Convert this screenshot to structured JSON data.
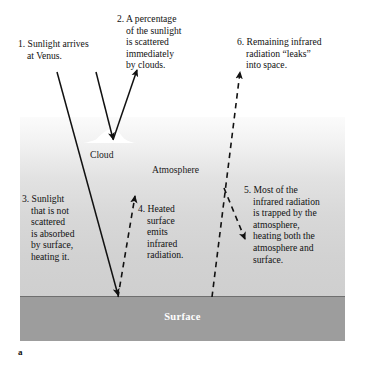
{
  "figure": {
    "letter": "a",
    "scene": {
      "atmosphere_label": "Atmosphere",
      "cloud_label": "Cloud",
      "surface_label": "Surface",
      "colors": {
        "surface_band": "#9d9d9d",
        "surface_line": "#6f6f6f",
        "atmosphere_top": "#fbfbfb",
        "atmosphere_bottom": "#cfcfcf",
        "cloud": "#ffffff",
        "arrow_solid": "#111111",
        "arrow_dashed": "#111111",
        "surface_text": "#ffffff"
      }
    },
    "callouts": [
      {
        "number": "1.",
        "text": "1. Sunlight arrives\nat Venus.",
        "name": "callout-sunlight-arrives"
      },
      {
        "number": "2.",
        "text": "2. A percentage\nof the sunlight\nis scattered\nimmediately\nby clouds.",
        "name": "callout-scattered-by-clouds"
      },
      {
        "number": "3.",
        "text": "3. Sunlight\nthat is not\nscattered\nis absorbed\nby surface,\nheating it.",
        "name": "callout-absorbed-by-surface"
      },
      {
        "number": "4.",
        "text": "4. Heated\nsurface\nemits\ninfrared\nradiation.",
        "name": "callout-surface-emits-infrared"
      },
      {
        "number": "5.",
        "text": "5. Most of the\ninfrared radiation\nis trapped by the\natmosphere,\nheating both the\natmosphere and\nsurface.",
        "name": "callout-trapped-by-atmosphere"
      },
      {
        "number": "6.",
        "text": "6. Remaining infrared\nradiation “leaks”\ninto space.",
        "name": "callout-leaks-into-space"
      }
    ],
    "arrows": [
      {
        "name": "arrow-sunlight-incoming-left",
        "style": "solid",
        "from": [
          57,
          72
        ],
        "to": [
          118,
          297
        ]
      },
      {
        "name": "arrow-sunlight-incoming-right",
        "style": "solid",
        "from": [
          96,
          72
        ],
        "to": [
          113,
          140
        ]
      },
      {
        "name": "arrow-scattered-outgoing",
        "style": "solid",
        "from": [
          113,
          140
        ],
        "to": [
          137,
          70
        ]
      },
      {
        "name": "arrow-surface-emits-infrared",
        "style": "dashed",
        "from": [
          118,
          297
        ],
        "to": [
          135,
          194
        ]
      },
      {
        "name": "arrow-infrared-escaping",
        "style": "dashed",
        "from": [
          212,
          297
        ],
        "to": [
          241,
          70
        ]
      },
      {
        "name": "arrow-infrared-trapped-down",
        "style": "dashed",
        "from": [
          224,
          188
        ],
        "to": [
          245,
          240
        ]
      }
    ]
  }
}
